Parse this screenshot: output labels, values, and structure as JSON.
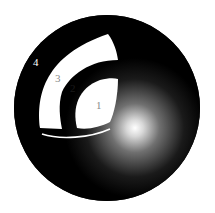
{
  "diagram": {
    "labels": [
      {
        "id": "4",
        "text": "4",
        "color": "#ffffff"
      },
      {
        "id": "3",
        "text": "3",
        "color": "#8a8a8a"
      },
      {
        "id": "2",
        "text": "2",
        "color": "#1a1a1a"
      },
      {
        "id": "1",
        "text": "1",
        "color": "#8a8a8a"
      }
    ],
    "colors": {
      "sphere": "#000000",
      "highlight": "#ffffff",
      "regions": "#ffffff"
    }
  }
}
